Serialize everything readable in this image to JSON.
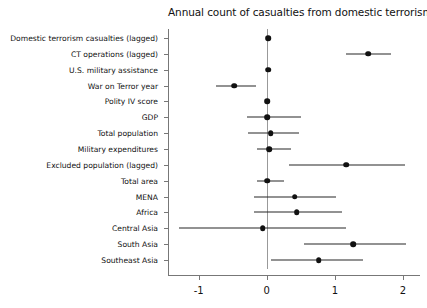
{
  "chart_data": {
    "type": "scatter",
    "subtype": "coefficient-forest-plot",
    "title": "Annual count of casualties from domestic terrorism",
    "xlabel": "",
    "ylabel": "",
    "xlim": [
      -1.45,
      2.25
    ],
    "xticks": [
      -1,
      0,
      1,
      2
    ],
    "xtick_labels": [
      "-1",
      "0",
      "1",
      "2"
    ],
    "grid": false,
    "legend": "none",
    "zero_reference_line": 0,
    "orientation": "horizontal",
    "categories": [
      "Domestic terrorism casualties (lagged)",
      "CT operations (lagged)",
      "U.S. military assistance",
      "War on Terror year",
      "Polity IV score",
      "GDP",
      "Total population",
      "Military expenditures",
      "Excluded population (lagged)",
      "Total area",
      "MENA",
      "Africa",
      "Central Asia",
      "South Asia",
      "Southeast Asia"
    ],
    "series": [
      {
        "name": "Coefficient estimate with 95% confidence interval",
        "points": [
          {
            "label": "Domestic terrorism casualties (lagged)",
            "estimate": 0.02,
            "ci_low": 0.0,
            "ci_high": 0.04
          },
          {
            "label": "CT operations (lagged)",
            "estimate": 1.49,
            "ci_low": 1.17,
            "ci_high": 1.82
          },
          {
            "label": "U.S. military assistance",
            "estimate": 0.02,
            "ci_low": -0.01,
            "ci_high": 0.05
          },
          {
            "label": "War on Terror year",
            "estimate": -0.48,
            "ci_low": -0.75,
            "ci_high": -0.16
          },
          {
            "label": "Polity IV score",
            "estimate": 0.01,
            "ci_low": -0.02,
            "ci_high": 0.04
          },
          {
            "label": "GDP",
            "estimate": 0.01,
            "ci_low": -0.29,
            "ci_high": 0.5
          },
          {
            "label": "Total population",
            "estimate": 0.06,
            "ci_low": -0.28,
            "ci_high": 0.48
          },
          {
            "label": "Military expenditures",
            "estimate": 0.04,
            "ci_low": -0.15,
            "ci_high": 0.35
          },
          {
            "label": "Excluded population (lagged)",
            "estimate": 1.17,
            "ci_low": 0.32,
            "ci_high": 2.03
          },
          {
            "label": "Total area",
            "estimate": 0.01,
            "ci_low": -0.15,
            "ci_high": 0.26
          },
          {
            "label": "MENA",
            "estimate": 0.41,
            "ci_low": -0.19,
            "ci_high": 1.01
          },
          {
            "label": "Africa",
            "estimate": 0.44,
            "ci_low": -0.19,
            "ci_high": 1.1
          },
          {
            "label": "Central Asia",
            "estimate": -0.06,
            "ci_low": -1.29,
            "ci_high": 1.16
          },
          {
            "label": "South Asia",
            "estimate": 1.27,
            "ci_low": 0.54,
            "ci_high": 2.05
          },
          {
            "label": "Southeast Asia",
            "estimate": 0.76,
            "ci_low": 0.06,
            "ci_high": 1.42
          }
        ]
      }
    ],
    "colors": {
      "point": "#111111",
      "interval": "#262626",
      "axis": "#777777",
      "zero_line": "#999999",
      "background": "#ffffff",
      "text": "#111111"
    }
  }
}
